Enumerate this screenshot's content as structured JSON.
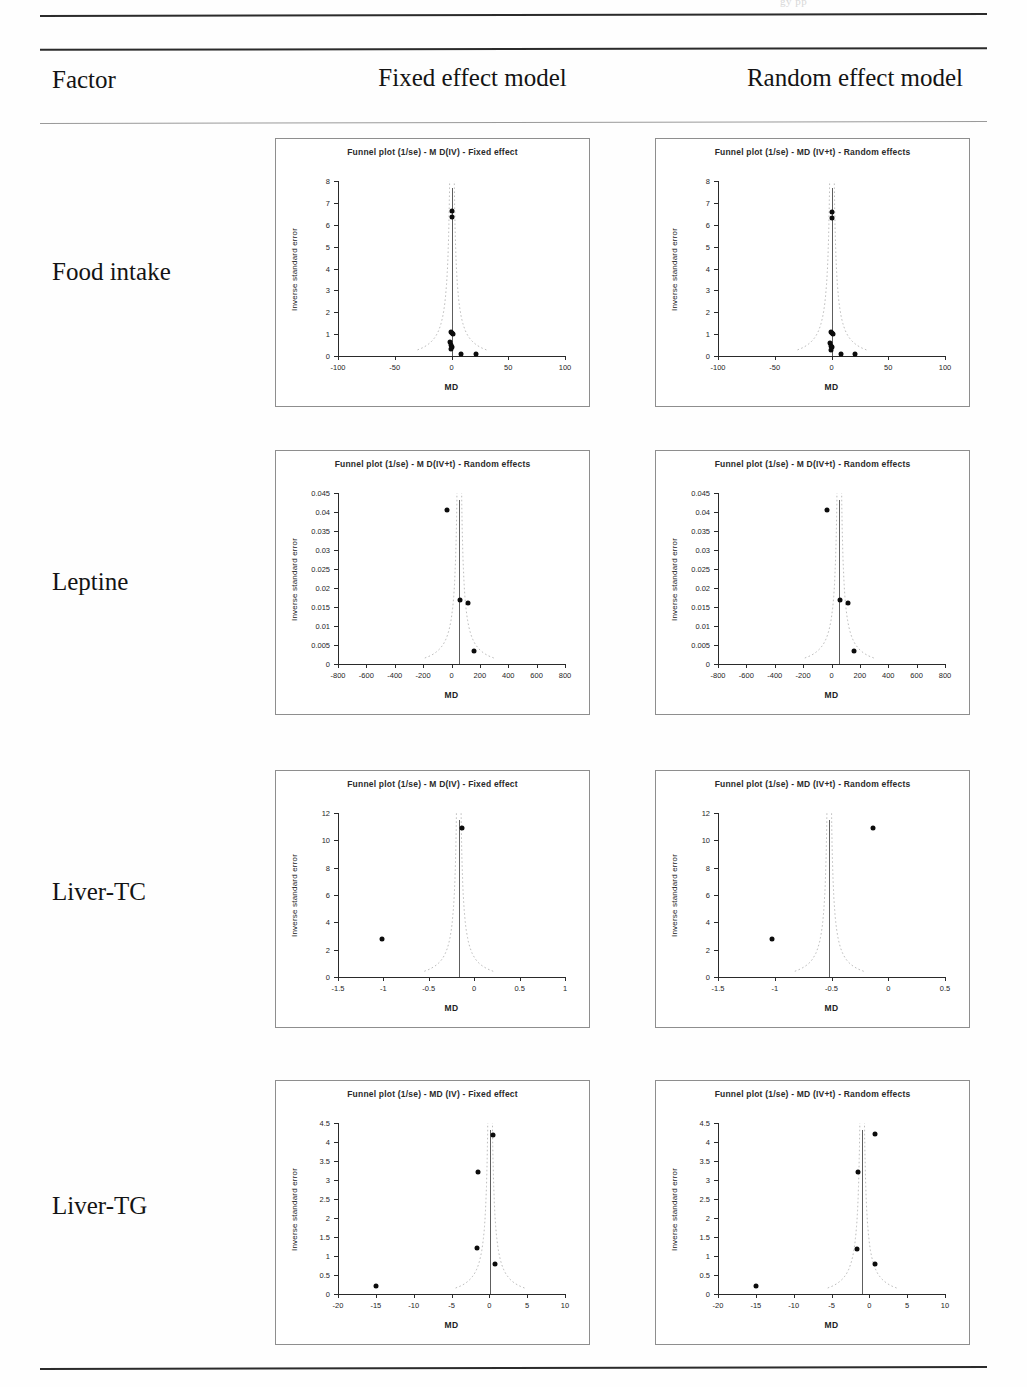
{
  "page": {
    "running_head": "gy                 pp",
    "column_headers": {
      "factor": "Factor",
      "fixed": "Fixed effect model",
      "random": "Random effect model"
    }
  },
  "rows": [
    {
      "label": "Food intake"
    },
    {
      "label": "Leptine"
    },
    {
      "label": "Liver-TC"
    },
    {
      "label": "Liver-TG"
    }
  ],
  "chart_data": [
    {
      "id": "food-intake-fixed",
      "row": "Food intake",
      "column": "Fixed effect model",
      "type": "scatter",
      "title": "Funnel plot (1/se) - M D(IV) - Fixed effect",
      "xlabel": "MD",
      "ylabel": "Inverse standard error",
      "xlim": [
        -100,
        100
      ],
      "ylim": [
        0,
        8
      ],
      "xticks": [
        -100,
        -50,
        0,
        50,
        100
      ],
      "xticklabels": [
        "-100",
        "-50",
        "0",
        "50",
        "100"
      ],
      "yticks": [
        0,
        1,
        2,
        3,
        4,
        5,
        6,
        7,
        8
      ],
      "yticklabels": [
        "0",
        "1",
        "2",
        "3",
        "4",
        "5",
        "6",
        "7",
        "8"
      ],
      "grid": false,
      "legend": "none",
      "center": 0.4,
      "points": [
        {
          "x": 0.3,
          "y": 6.65
        },
        {
          "x": 0.2,
          "y": 6.35
        },
        {
          "x": -0.6,
          "y": 1.1
        },
        {
          "x": 0.5,
          "y": 1.05
        },
        {
          "x": 0.9,
          "y": 1.0
        },
        {
          "x": -0.9,
          "y": 0.62
        },
        {
          "x": -0.4,
          "y": 0.5
        },
        {
          "x": 0.1,
          "y": 0.42
        },
        {
          "x": -0.2,
          "y": 0.3
        },
        {
          "x": 8.5,
          "y": 0.07
        },
        {
          "x": 21.5,
          "y": 0.07
        }
      ]
    },
    {
      "id": "food-intake-random",
      "row": "Food intake",
      "column": "Random effect model",
      "type": "scatter",
      "title": "Funnel plot (1/se) - MD (IV+t) - Random effects",
      "xlabel": "MD",
      "ylabel": "Inverse standard error",
      "xlim": [
        -100,
        100
      ],
      "ylim": [
        0,
        8
      ],
      "xticks": [
        -100,
        -50,
        0,
        50,
        100
      ],
      "xticklabels": [
        "-100",
        "-50",
        "0",
        "50",
        "100"
      ],
      "yticks": [
        0,
        1,
        2,
        3,
        4,
        5,
        6,
        7,
        8
      ],
      "yticklabels": [
        "0",
        "1",
        "2",
        "3",
        "4",
        "5",
        "6",
        "7",
        "8"
      ],
      "grid": false,
      "legend": "none",
      "center": 0.4,
      "points": [
        {
          "x": 0.3,
          "y": 6.6
        },
        {
          "x": 0.2,
          "y": 6.3
        },
        {
          "x": -0.6,
          "y": 1.1
        },
        {
          "x": 0.5,
          "y": 1.05
        },
        {
          "x": 0.9,
          "y": 1.0
        },
        {
          "x": -0.9,
          "y": 0.6
        },
        {
          "x": -0.4,
          "y": 0.48
        },
        {
          "x": 0.1,
          "y": 0.4
        },
        {
          "x": -0.2,
          "y": 0.28
        },
        {
          "x": 8.0,
          "y": 0.07
        },
        {
          "x": 21.0,
          "y": 0.07
        }
      ]
    },
    {
      "id": "leptine-fixed",
      "row": "Leptine",
      "column": "Fixed effect model",
      "type": "scatter",
      "title": "Funnel plot (1/se) - M D(IV+t) - Random effects",
      "xlabel": "MD",
      "ylabel": "Inverse standard error",
      "xlim": [
        -800,
        800
      ],
      "ylim": [
        0,
        0.045
      ],
      "xticks": [
        -800,
        -600,
        -400,
        -200,
        0,
        200,
        400,
        600,
        800
      ],
      "xticklabels": [
        "-800",
        "-600",
        "-400",
        "-200",
        "0",
        "200",
        "400",
        "600",
        "800"
      ],
      "yticks": [
        0,
        0.005,
        0.01,
        0.015,
        0.02,
        0.025,
        0.03,
        0.035,
        0.04,
        0.045
      ],
      "yticklabels": [
        "0",
        "0.005",
        "0.01",
        "0.015",
        "0.02",
        "0.025",
        "0.03",
        "0.035",
        "0.04",
        "0.045"
      ],
      "grid": false,
      "legend": "none",
      "center": 55,
      "points": [
        {
          "x": -35,
          "y": 0.0405
        },
        {
          "x": 60,
          "y": 0.0168
        },
        {
          "x": 115,
          "y": 0.0161
        },
        {
          "x": 160,
          "y": 0.0034
        }
      ]
    },
    {
      "id": "leptine-random",
      "row": "Leptine",
      "column": "Random effect model",
      "type": "scatter",
      "title": "Funnel plot (1/se) - M D(IV+t) - Random effects",
      "xlabel": "MD",
      "ylabel": "Inverse standard error",
      "xlim": [
        -800,
        800
      ],
      "ylim": [
        0,
        0.045
      ],
      "xticks": [
        -800,
        -600,
        -400,
        -200,
        0,
        200,
        400,
        600,
        800
      ],
      "xticklabels": [
        "-800",
        "-600",
        "-400",
        "-200",
        "0",
        "200",
        "400",
        "600",
        "800"
      ],
      "yticks": [
        0,
        0.005,
        0.01,
        0.015,
        0.02,
        0.025,
        0.03,
        0.035,
        0.04,
        0.045
      ],
      "yticklabels": [
        "0",
        "0.005",
        "0.01",
        "0.015",
        "0.02",
        "0.025",
        "0.03",
        "0.035",
        "0.04",
        "0.045"
      ],
      "grid": false,
      "legend": "none",
      "center": 55,
      "points": [
        {
          "x": -35,
          "y": 0.0405
        },
        {
          "x": 60,
          "y": 0.0168
        },
        {
          "x": 118,
          "y": 0.0161
        },
        {
          "x": 162,
          "y": 0.0034
        }
      ]
    },
    {
      "id": "liver-tc-fixed",
      "row": "Liver-TC",
      "column": "Fixed effect model",
      "type": "scatter",
      "title": "Funnel plot (1/se) - M D(IV) - Fixed effect",
      "xlabel": "MD",
      "ylabel": "Inverse standard error",
      "xlim": [
        -1.5,
        1
      ],
      "ylim": [
        0,
        12
      ],
      "xticks": [
        -1.5,
        -1,
        -0.5,
        0,
        0.5,
        1
      ],
      "xticklabels": [
        "-1.5",
        "-1",
        "-0.5",
        "0",
        "0.5",
        "1"
      ],
      "yticks": [
        0,
        2,
        4,
        6,
        8,
        10,
        12
      ],
      "yticklabels": [
        "0",
        "2",
        "4",
        "6",
        "8",
        "10",
        "12"
      ],
      "grid": false,
      "legend": "none",
      "center": -0.17,
      "points": [
        {
          "x": -0.13,
          "y": 10.9
        },
        {
          "x": -1.02,
          "y": 2.8
        }
      ]
    },
    {
      "id": "liver-tc-random",
      "row": "Liver-TC",
      "column": "Random effect model",
      "type": "scatter",
      "title": "Funnel plot (1/se) - MD (IV+t) - Random effects",
      "xlabel": "MD",
      "ylabel": "Inverse standard error",
      "xlim": [
        -1.5,
        0.5
      ],
      "ylim": [
        0,
        12
      ],
      "xticks": [
        -1.5,
        -1,
        -0.5,
        0,
        0.5
      ],
      "xticklabels": [
        "-1.5",
        "-1",
        "-0.5",
        "0",
        "0.5"
      ],
      "yticks": [
        0,
        2,
        4,
        6,
        8,
        10,
        12
      ],
      "yticklabels": [
        "0",
        "2",
        "4",
        "6",
        "8",
        "10",
        "12"
      ],
      "grid": false,
      "legend": "none",
      "center": -0.52,
      "points": [
        {
          "x": -0.13,
          "y": 10.9
        },
        {
          "x": -1.02,
          "y": 2.8
        }
      ]
    },
    {
      "id": "liver-tg-fixed",
      "row": "Liver-TG",
      "column": "Fixed effect model",
      "type": "scatter",
      "title": "Funnel plot (1/se) - MD (IV) - Fixed effect",
      "xlabel": "MD",
      "ylabel": "Inverse standard error",
      "xlim": [
        -20,
        10
      ],
      "ylim": [
        0,
        4.5
      ],
      "xticks": [
        -20,
        -15,
        -10,
        -5,
        0,
        5,
        10
      ],
      "xticklabels": [
        "-20",
        "-15",
        "-10",
        "-5",
        "0",
        "5",
        "10"
      ],
      "yticks": [
        0,
        0.5,
        1,
        1.5,
        2,
        2.5,
        3,
        3.5,
        4,
        4.5
      ],
      "yticklabels": [
        "0",
        "0.5",
        "1",
        "1.5",
        "2",
        "2.5",
        "3",
        "3.5",
        "4",
        "4.5"
      ],
      "grid": false,
      "legend": "none",
      "center": 0.1,
      "points": [
        {
          "x": 0.55,
          "y": 4.18
        },
        {
          "x": -1.5,
          "y": 3.22
        },
        {
          "x": -1.6,
          "y": 1.2
        },
        {
          "x": 0.8,
          "y": 0.8
        },
        {
          "x": -15.0,
          "y": 0.22
        }
      ]
    },
    {
      "id": "liver-tg-random",
      "row": "Liver-TG",
      "column": "Random effect model",
      "type": "scatter",
      "title": "Funnel plot (1/se) - MD (IV+t) - Random effects",
      "xlabel": "MD",
      "ylabel": "Inverse standard error",
      "xlim": [
        -20,
        10
      ],
      "ylim": [
        0,
        4.5
      ],
      "xticks": [
        -20,
        -15,
        -10,
        -5,
        0,
        5,
        10
      ],
      "xticklabels": [
        "-20",
        "-15",
        "-10",
        "-5",
        "0",
        "5",
        "10"
      ],
      "yticks": [
        0,
        0.5,
        1,
        1.5,
        2,
        2.5,
        3,
        3.5,
        4,
        4.5
      ],
      "yticklabels": [
        "0",
        "0.5",
        "1",
        "1.5",
        "2",
        "2.5",
        "3",
        "3.5",
        "4",
        "4.5"
      ],
      "grid": false,
      "legend": "none",
      "center": -0.95,
      "points": [
        {
          "x": 0.7,
          "y": 4.2
        },
        {
          "x": -1.5,
          "y": 3.22
        },
        {
          "x": -1.6,
          "y": 1.18
        },
        {
          "x": 0.8,
          "y": 0.78
        },
        {
          "x": -15.0,
          "y": 0.22
        }
      ]
    }
  ],
  "layout": {
    "chart_slots": [
      {
        "id": "food-intake-fixed",
        "left": 275,
        "top": 138,
        "width": 315,
        "height": 269
      },
      {
        "id": "food-intake-random",
        "left": 655,
        "top": 138,
        "width": 315,
        "height": 269
      },
      {
        "id": "leptine-fixed",
        "left": 275,
        "top": 450,
        "width": 315,
        "height": 265
      },
      {
        "id": "leptine-random",
        "left": 655,
        "top": 450,
        "width": 315,
        "height": 265
      },
      {
        "id": "liver-tc-fixed",
        "left": 275,
        "top": 770,
        "width": 315,
        "height": 258
      },
      {
        "id": "liver-tc-random",
        "left": 655,
        "top": 770,
        "width": 315,
        "height": 258
      },
      {
        "id": "liver-tg-fixed",
        "left": 275,
        "top": 1080,
        "width": 315,
        "height": 265
      },
      {
        "id": "liver-tg-random",
        "left": 655,
        "top": 1080,
        "width": 315,
        "height": 265
      }
    ],
    "row_label_tops": [
      258,
      568,
      878,
      1192
    ]
  }
}
